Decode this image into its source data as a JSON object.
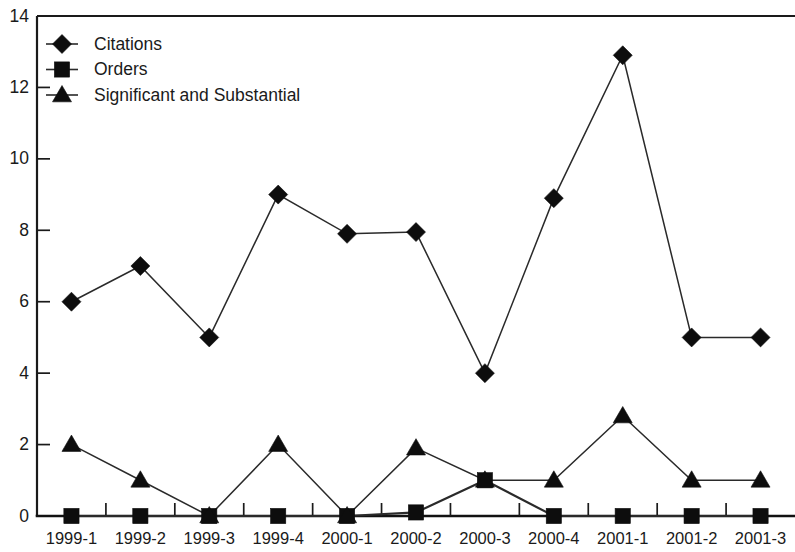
{
  "chart_data": {
    "type": "line",
    "title": "",
    "subtitle": "",
    "xlabel": "",
    "ylabel": "",
    "categories": [
      "1999-1",
      "1999-2",
      "1999-3",
      "1999-4",
      "2000-1",
      "2000-2",
      "2000-3",
      "2000-4",
      "2001-1",
      "2001-2",
      "2001-3"
    ],
    "series": [
      {
        "name": "Citations",
        "marker": "diamond",
        "color": "#0d0d0d",
        "values": [
          6,
          7,
          5,
          9,
          7.9,
          7.95,
          4,
          8.9,
          12.9,
          5,
          5
        ]
      },
      {
        "name": "Orders",
        "marker": "square",
        "color": "#0d0d0d",
        "values": [
          0,
          0,
          0,
          0,
          0,
          0.1,
          1,
          0,
          0,
          0,
          0
        ]
      },
      {
        "name": "Significant and Substantial",
        "marker": "triangle",
        "color": "#0d0d0d",
        "values": [
          2,
          1,
          0,
          2,
          0,
          1.9,
          1,
          1,
          2.8,
          1,
          1
        ]
      }
    ],
    "ylim": [
      0,
      14
    ],
    "ytick_labels": [
      "0",
      "2",
      "4",
      "6",
      "8",
      "10",
      "12",
      "14"
    ],
    "ytick_values": [
      0,
      2,
      4,
      6,
      8,
      10,
      12,
      14
    ],
    "grid": false,
    "legend_position": "top-left",
    "legend_entries": [
      "Citations",
      "Orders",
      "Significant and Substantial"
    ],
    "annotations": []
  },
  "legend": {
    "items": [
      {
        "label": "Citations",
        "marker": "diamond-icon"
      },
      {
        "label": "Orders",
        "marker": "square-icon"
      },
      {
        "label": "Significant and Substantial",
        "marker": "triangle-icon"
      }
    ]
  },
  "axes": {
    "y_ticks": [
      "0",
      "2",
      "4",
      "6",
      "8",
      "10",
      "12",
      "14"
    ],
    "x_ticks": [
      "1999-1",
      "1999-2",
      "1999-3",
      "1999-4",
      "2000-1",
      "2000-2",
      "2000-3",
      "2000-4",
      "2001-1",
      "2001-2",
      "2001-3"
    ]
  },
  "colors": {
    "background": "#ffffff",
    "ink": "#1a1a1a",
    "marker": "#0d0d0d",
    "line": "#2a2a2a"
  }
}
